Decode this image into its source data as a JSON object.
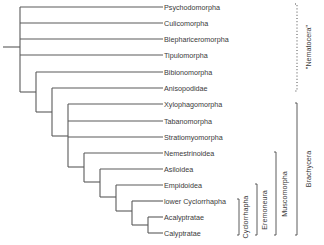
{
  "diagram": {
    "type": "phylogenetic-tree",
    "taxa": [
      "Psychodomorpha",
      "Culicomorpha",
      "Blephariceromorpha",
      "Tipulomorpha",
      "Bibionomorpha",
      "Anisopodidae",
      "Xylophagomorpha",
      "Tabanomorpha",
      "Stratiomyomorpha",
      "Nemestrinoidea",
      "Asiloidea",
      "Empidoidea",
      "lower Cyclorrhapha",
      "Acalyptratae",
      "Calyptratae"
    ],
    "clades": {
      "nematocera": "\"Nematocera\"",
      "brachycera": "Brachycera",
      "muscomorpha": "Muscomorpha",
      "eremoneura": "Eremoneura",
      "cyclorrhapha": "Cyclorrhapha"
    },
    "topology": "((Psychodomorpha, Culicomorpha, Blephariceromorpha, Tipulomorpha, (Bibionomorpha, (Anisopodidae, (Xylophagomorpha, Tabanomorpha, Stratiomyomorpha, (Nemestrinoidea, (Asiloidea, (Empidoidea, (lower Cyclorrhapha, (Acalyptratae, Calyptratae)))))))))"
  }
}
